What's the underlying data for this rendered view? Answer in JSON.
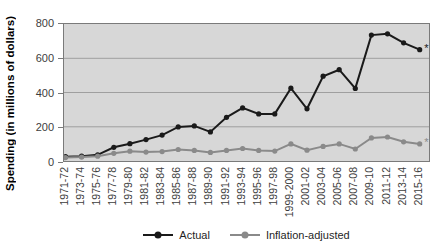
{
  "chart_data": {
    "type": "line",
    "title": "",
    "xlabel": "",
    "ylabel": "Spending (in millions of dollars)",
    "ylim": [
      0,
      800
    ],
    "yticks": [
      0,
      200,
      400,
      600,
      800
    ],
    "grid": true,
    "legend_position": "bottom",
    "plot_background": "#d7d7d7",
    "gridline_color": "#9f9f9f",
    "categories": [
      "1971-72",
      "1973-74",
      "1975-76",
      "1977-78",
      "1979-80",
      "1981-82",
      "1983-84",
      "1985-86",
      "1987-88",
      "1989-90",
      "1991-92",
      "1993-94",
      "1995-96",
      "1997-98",
      "1999-2000",
      "2001-02",
      "2003-04",
      "2005-06",
      "2007-08",
      "2009-10",
      "2011-12",
      "2013-14",
      "2015-16"
    ],
    "series": [
      {
        "name": "Actual",
        "color": "#1a1a1a",
        "end_annotation": "*",
        "values": [
          25,
          28,
          36,
          80,
          101,
          125,
          151,
          199,
          205,
          170,
          255,
          310,
          275,
          275,
          425,
          305,
          495,
          533,
          424,
          735,
          743,
          690,
          650
        ]
      },
      {
        "name": "Inflation-adjusted",
        "color": "#8a8a8a",
        "end_annotation": "*",
        "values": [
          20,
          23,
          28,
          45,
          57,
          52,
          55,
          67,
          62,
          50,
          62,
          73,
          62,
          58,
          100,
          63,
          85,
          100,
          70,
          135,
          140,
          112,
          100
        ]
      }
    ]
  }
}
